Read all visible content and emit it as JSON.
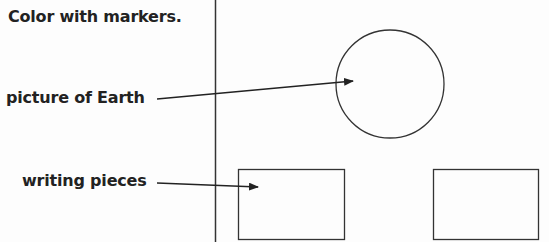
{
  "instructions": {
    "text": "Color with markers."
  },
  "labels": [
    {
      "text": "picture of Earth"
    },
    {
      "text": "writing pieces"
    }
  ],
  "colors": {
    "ink": "#222222",
    "background": "#fdfdfd"
  }
}
